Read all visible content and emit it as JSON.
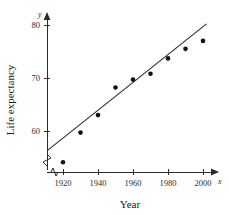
{
  "chart_data": {
    "type": "scatter",
    "title": "",
    "xlabel": "Year",
    "ylabel": "Life expectancy",
    "x_axis_variable": "x",
    "y_axis_variable": "y",
    "xlim": [
      1910,
      2005
    ],
    "ylim": [
      53,
      82
    ],
    "grid": false,
    "legend": "none",
    "axis_break": "y-axis broken below 55",
    "x_ticks": [
      1920,
      1940,
      1960,
      1980,
      2000
    ],
    "x_tick_labels": [
      "1920",
      "1940",
      "1960",
      "1980",
      "2000"
    ],
    "y_ticks": [
      60,
      70,
      80
    ],
    "y_tick_labels": [
      "60",
      "70",
      "80"
    ],
    "x": [
      1920,
      1930,
      1940,
      1950,
      1960,
      1970,
      1980,
      1990,
      2000
    ],
    "values": [
      54.1,
      59.7,
      63.0,
      68.2,
      69.7,
      70.8,
      73.7,
      75.5,
      77.0
    ],
    "series": [
      {
        "name": "Life expectancy",
        "marker": "filled-circle",
        "color": "#111111",
        "points": [
          {
            "x": 1920,
            "y": 54.1
          },
          {
            "x": 1930,
            "y": 59.7
          },
          {
            "x": 1940,
            "y": 63.0
          },
          {
            "x": 1950,
            "y": 68.2
          },
          {
            "x": 1960,
            "y": 69.7
          },
          {
            "x": 1970,
            "y": 70.8
          },
          {
            "x": 1980,
            "y": 73.7
          },
          {
            "x": 1990,
            "y": 75.5
          },
          {
            "x": 2000,
            "y": 77.0
          }
        ]
      }
    ],
    "trend_line": {
      "name": "line of best fit",
      "color": "#2b2b2b",
      "x_start": 1911,
      "y_start": 56.3,
      "x_end": 2002,
      "y_end": 80.2
    }
  },
  "colors": {
    "axis": "#2b2b2b",
    "marker": "#111111",
    "trend": "#2b2b2b",
    "background": "#ffffff"
  }
}
